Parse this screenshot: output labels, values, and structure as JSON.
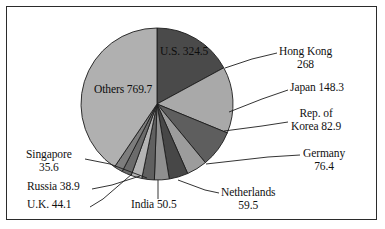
{
  "figure": {
    "border_color": "#2b2b2b",
    "background": "#ffffff"
  },
  "chart_data": {
    "type": "pie",
    "title": "",
    "subtitle": "",
    "xlabel": "",
    "ylabel": "",
    "legend_position": "none",
    "grid": false,
    "total": 1898.4,
    "start_angle_deg": 0,
    "direction": "clockwise",
    "categories": [
      "U.S.",
      "Hong Kong",
      "Japan",
      "Rep. of Korea",
      "Germany",
      "Netherlands",
      "India",
      "U.K.",
      "Russia",
      "Singapore",
      "Others"
    ],
    "values": [
      324.5,
      268,
      148.3,
      82.9,
      76.4,
      59.5,
      50.5,
      44.1,
      38.9,
      35.6,
      769.7
    ],
    "colors": [
      "#4a4a4a",
      "#a9a9a9",
      "#5e5e5e",
      "#9c9c9c",
      "#474747",
      "#8f8f8f",
      "#606060",
      "#b4b4b4",
      "#6b6b6b",
      "#7d7d7d",
      "#b0b0b0"
    ],
    "slice_edge_color": "#1d1d1d"
  },
  "slices": {
    "us": {
      "label": "U.S. 324.5",
      "name": "U.S.",
      "value": 324.5
    },
    "hong_kong": {
      "name": "Hong Kong",
      "line1": "Hong Kong",
      "line2": "268",
      "value": 268
    },
    "japan": {
      "label": "Japan 148.3",
      "name": "Japan",
      "value": 148.3
    },
    "korea": {
      "name": "Rep. of Korea",
      "line1": "Rep. of",
      "line2": "Korea 82.9",
      "value": 82.9
    },
    "germany": {
      "name": "Germany",
      "line1": "Germany",
      "line2": "76.4",
      "value": 76.4
    },
    "netherlands": {
      "name": "Netherlands",
      "line1": "Netherlands",
      "line2": "59.5",
      "value": 59.5
    },
    "india": {
      "label": "India 50.5",
      "name": "India",
      "value": 50.5
    },
    "uk": {
      "label": "U.K. 44.1",
      "name": "U.K.",
      "value": 44.1
    },
    "russia": {
      "label": "Russia 38.9",
      "name": "Russia",
      "value": 38.9
    },
    "singapore": {
      "name": "Singapore",
      "line1": "Singapore",
      "line2": "35.6",
      "value": 35.6
    },
    "others": {
      "label": "Others 769.7",
      "name": "Others",
      "value": 769.7
    }
  }
}
